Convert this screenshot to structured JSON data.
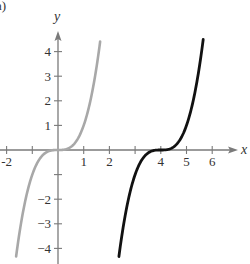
{
  "panel_label": "a)",
  "chart_data": {
    "type": "line",
    "title": "",
    "xlabel": "x",
    "ylabel": "y",
    "xlim": [
      -2.2,
      7
    ],
    "ylim": [
      -4.5,
      4.8
    ],
    "grid": false,
    "x_ticks": [
      -2,
      -1,
      1,
      2,
      3,
      4,
      5,
      6
    ],
    "x_tick_labels": [
      "-2",
      "",
      "1",
      "2",
      "",
      "4",
      "5",
      "6"
    ],
    "y_ticks": [
      -4,
      -3,
      -2,
      -1,
      1,
      2,
      3,
      4
    ],
    "y_tick_labels": [
      "−4",
      "−3",
      "−2",
      "",
      "1",
      "2",
      "3",
      "4"
    ],
    "series": [
      {
        "name": "y = x^3",
        "color": "#a8a8a8",
        "expr": "x^3",
        "x_range": [
          -1.63,
          1.64
        ]
      },
      {
        "name": "y = (x-4)^3",
        "color": "#111111",
        "expr": "(x-4)^3",
        "x_range": [
          2.37,
          5.65
        ]
      }
    ]
  },
  "colors": {
    "axis": "#7a7a7a",
    "text": "#333333"
  }
}
